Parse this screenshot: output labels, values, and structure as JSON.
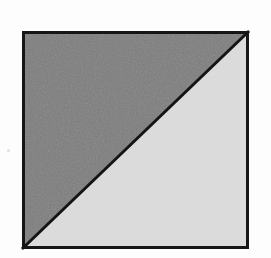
{
  "figure": {
    "caption": "",
    "background_color": "#fdfdfd",
    "media": "scanned printed page",
    "square": {
      "name": "outlined square",
      "left": 22,
      "top": 31,
      "right": 249,
      "bottom": 249,
      "width": 227,
      "height": 218,
      "border_color": "#161616",
      "border_width": 3
    },
    "diagonal": {
      "name": "diagonal line",
      "from_corner": "bottom-left",
      "to_corner": "top-right",
      "x1": 22,
      "y1": 249,
      "x2": 249,
      "y2": 31,
      "color": "#141414",
      "width": 3
    },
    "regions": [
      {
        "name": "upper-left-triangle",
        "label": "",
        "shade": "dark gray",
        "fill_color": "#7c7c7c",
        "vertices": [
          [
            22,
            31
          ],
          [
            249,
            31
          ],
          [
            22,
            249
          ]
        ]
      },
      {
        "name": "lower-right-triangle",
        "label": "",
        "shade": "light gray",
        "fill_color": "#dcdcdc",
        "vertices": [
          [
            249,
            31
          ],
          [
            249,
            249
          ],
          [
            22,
            249
          ]
        ]
      }
    ],
    "artifacts": [
      {
        "name": "margin-speck",
        "x": 7,
        "y": 149,
        "color": "#d9d9d9"
      }
    ]
  }
}
